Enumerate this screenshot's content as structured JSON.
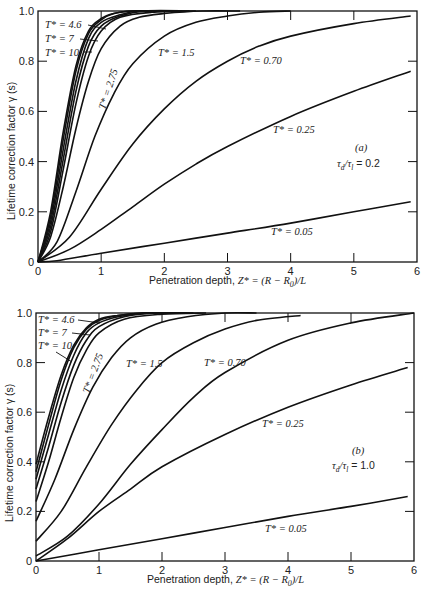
{
  "figure": {
    "panels": [
      "(a)",
      "(b)"
    ]
  },
  "chart_data": [
    {
      "type": "line",
      "panel_label": "(a)",
      "parameter_label": "τd/τl = 0.2",
      "xlabel": "Penetration depth, Z* = (R − R0)/L",
      "ylabel": "Lifetime correction factor γ (s)",
      "xlim": [
        0,
        6
      ],
      "ylim": [
        0,
        1.0
      ],
      "xticks": [
        "0",
        "1",
        "2",
        "3",
        "4",
        "5",
        "6"
      ],
      "yticks": [
        "0",
        "0.2",
        "0.4",
        "0.6",
        "0.8",
        "1.0"
      ],
      "grid": false,
      "series": [
        {
          "name": "T* = 10",
          "x": [
            0,
            0.2,
            0.4,
            0.6,
            0.8,
            1.0,
            1.2,
            1.5,
            2.0
          ],
          "y": [
            0,
            0.2,
            0.52,
            0.78,
            0.92,
            0.97,
            0.99,
            1.0,
            1.0
          ]
        },
        {
          "name": "T* = 7",
          "x": [
            0,
            0.2,
            0.4,
            0.6,
            0.8,
            1.0,
            1.2,
            1.5,
            2.0
          ],
          "y": [
            0,
            0.18,
            0.49,
            0.76,
            0.91,
            0.965,
            0.99,
            1.0,
            1.0
          ]
        },
        {
          "name": "T* = 4.6",
          "x": [
            0,
            0.2,
            0.4,
            0.6,
            0.8,
            1.0,
            1.3,
            1.6,
            2.2
          ],
          "y": [
            0,
            0.16,
            0.45,
            0.72,
            0.89,
            0.955,
            0.985,
            1.0,
            1.0
          ]
        },
        {
          "name": "T* = 3.6",
          "x": [
            0,
            0.2,
            0.4,
            0.6,
            0.8,
            1.0,
            1.3,
            1.7,
            2.4
          ],
          "y": [
            0,
            0.14,
            0.41,
            0.68,
            0.86,
            0.94,
            0.98,
            1.0,
            1.0
          ]
        },
        {
          "name": "T* = 3.1",
          "x": [
            0,
            0.2,
            0.4,
            0.6,
            0.8,
            1.0,
            1.3,
            1.8,
            2.5
          ],
          "y": [
            0,
            0.12,
            0.37,
            0.63,
            0.82,
            0.92,
            0.975,
            0.995,
            1.0
          ]
        },
        {
          "name": "T* = 2.75",
          "x": [
            0,
            0.2,
            0.4,
            0.6,
            0.8,
            1.0,
            1.3,
            1.6,
            2.0,
            2.6,
            3.2
          ],
          "y": [
            0,
            0.1,
            0.3,
            0.53,
            0.72,
            0.85,
            0.94,
            0.975,
            0.99,
            1.0,
            1.0
          ]
        },
        {
          "name": "T* = 1.5",
          "x": [
            0,
            0.3,
            0.6,
            0.9,
            1.2,
            1.5,
            2.0,
            2.5,
            3.0,
            3.5,
            4.0
          ],
          "y": [
            0,
            0.08,
            0.28,
            0.5,
            0.67,
            0.79,
            0.9,
            0.955,
            0.98,
            0.995,
            1.0
          ]
        },
        {
          "name": "T* = 0.70",
          "x": [
            0,
            0.5,
            1.0,
            1.5,
            2.0,
            2.5,
            3.0,
            3.5,
            4.0,
            5.0,
            5.9
          ],
          "y": [
            0,
            0.1,
            0.29,
            0.47,
            0.61,
            0.72,
            0.8,
            0.86,
            0.9,
            0.95,
            0.98
          ]
        },
        {
          "name": "T* = 0.25",
          "x": [
            0,
            0.5,
            1.0,
            1.5,
            2.0,
            2.5,
            3.0,
            4.0,
            5.0,
            5.9
          ],
          "y": [
            0,
            0.05,
            0.13,
            0.22,
            0.31,
            0.39,
            0.46,
            0.58,
            0.68,
            0.76
          ]
        },
        {
          "name": "T* = 0.05",
          "x": [
            0,
            0.3,
            1.0,
            2.0,
            3.0,
            4.0,
            5.0,
            5.9
          ],
          "y": [
            0,
            0.005,
            0.035,
            0.075,
            0.115,
            0.155,
            0.2,
            0.24
          ]
        }
      ]
    },
    {
      "type": "line",
      "panel_label": "(b)",
      "parameter_label": "τd/τl = 1.0",
      "xlabel": "Penetration depth, Z* = (R − R0)/L",
      "ylabel": "Lifetime correction factor γ (s)",
      "xlim": [
        0,
        6
      ],
      "ylim": [
        0,
        1.0
      ],
      "xticks": [
        "0",
        "1",
        "2",
        "3",
        "4",
        "5",
        "6"
      ],
      "yticks": [
        "0",
        "0.2",
        "0.4",
        "0.6",
        "0.8",
        "1.0"
      ],
      "grid": false,
      "series": [
        {
          "name": "T* = 10",
          "x": [
            0,
            0.2,
            0.4,
            0.6,
            0.8,
            1.0,
            1.3,
            1.7,
            2.2
          ],
          "y": [
            0.39,
            0.58,
            0.75,
            0.87,
            0.94,
            0.975,
            0.99,
            1.0,
            1.0
          ]
        },
        {
          "name": "T* = 7",
          "x": [
            0,
            0.2,
            0.4,
            0.6,
            0.8,
            1.0,
            1.3,
            1.7,
            2.3
          ],
          "y": [
            0.36,
            0.55,
            0.73,
            0.86,
            0.935,
            0.97,
            0.99,
            1.0,
            1.0
          ]
        },
        {
          "name": "T* = 4.6",
          "x": [
            0,
            0.2,
            0.4,
            0.6,
            0.8,
            1.0,
            1.3,
            1.8,
            2.4
          ],
          "y": [
            0.33,
            0.51,
            0.69,
            0.83,
            0.92,
            0.96,
            0.985,
            1.0,
            1.0
          ]
        },
        {
          "name": "T* = 3.6",
          "x": [
            0,
            0.2,
            0.4,
            0.6,
            0.8,
            1.0,
            1.4,
            1.9,
            2.5
          ],
          "y": [
            0.29,
            0.46,
            0.64,
            0.79,
            0.89,
            0.945,
            0.985,
            1.0,
            1.0
          ]
        },
        {
          "name": "T* = 3.1",
          "x": [
            0,
            0.2,
            0.4,
            0.6,
            0.8,
            1.0,
            1.4,
            2.0,
            2.7
          ],
          "y": [
            0.24,
            0.4,
            0.58,
            0.74,
            0.85,
            0.92,
            0.975,
            0.995,
            1.0
          ]
        },
        {
          "name": "T* = 2.75",
          "x": [
            0,
            0.3,
            0.6,
            0.9,
            1.2,
            1.5,
            1.9,
            2.4,
            3.0,
            3.5
          ],
          "y": [
            0.16,
            0.33,
            0.53,
            0.7,
            0.82,
            0.9,
            0.955,
            0.985,
            1.0,
            1.0
          ]
        },
        {
          "name": "T* = 1.5",
          "x": [
            0,
            0.4,
            0.8,
            1.2,
            1.6,
            2.0,
            2.5,
            3.0,
            3.5,
            4.2
          ],
          "y": [
            0.08,
            0.2,
            0.38,
            0.55,
            0.69,
            0.8,
            0.88,
            0.935,
            0.97,
            0.99
          ]
        },
        {
          "name": "T* = 0.70",
          "x": [
            0,
            0.5,
            1.0,
            1.5,
            2.0,
            2.5,
            3.0,
            4.0,
            5.0,
            6.0
          ],
          "y": [
            0.02,
            0.1,
            0.23,
            0.39,
            0.53,
            0.66,
            0.76,
            0.89,
            0.96,
            1.0
          ]
        },
        {
          "name": "T* = 0.25",
          "x": [
            0,
            0.5,
            1.0,
            1.5,
            2.0,
            3.0,
            4.0,
            5.0,
            5.9
          ],
          "y": [
            0.0,
            0.09,
            0.2,
            0.29,
            0.38,
            0.51,
            0.62,
            0.71,
            0.78
          ]
        },
        {
          "name": "T* = 0.05",
          "x": [
            0,
            1.0,
            2.0,
            3.0,
            4.0,
            5.0,
            5.9
          ],
          "y": [
            0.0,
            0.045,
            0.09,
            0.135,
            0.18,
            0.22,
            0.26
          ]
        }
      ]
    }
  ],
  "panels": {
    "a": {
      "label": "(a)",
      "ratio_tau": "τ",
      "ratio_d": "d",
      "ratio_slash": "/τ",
      "ratio_l": "l",
      "ratio_value": " = 0.2",
      "ylabel": "Lifetime correction factor  γ (s)",
      "xlabel_text": "Penetration depth, ",
      "xlabel_math": "Z* = (R − R",
      "xlabel_sub": "0",
      "xlabel_tail": ")/L",
      "labels": {
        "t46": "T* = 4.6",
        "t7": "T* = 7",
        "t10": "T* = 10",
        "t275": "T* = 2.75",
        "t15": "T* = 1.5",
        "t070": "T* = 0.70",
        "t025": "T* = 0.25",
        "t005": "T* = 0.05"
      }
    },
    "b": {
      "label": "(b)",
      "ratio_tau": "τ",
      "ratio_d": "d",
      "ratio_slash": "/τ",
      "ratio_l": "l",
      "ratio_value": " = 1.0",
      "ylabel": "Lifetime correction factor  γ (s)",
      "xlabel_text": "Penetration depth, ",
      "xlabel_math": "Z* = (R − R",
      "xlabel_sub": "0",
      "xlabel_tail": ")/L",
      "labels": {
        "t46": "T* = 4.6",
        "t7": "T* = 7",
        "t10": "T* = 10",
        "t275": "T* = 2.75",
        "t15": "T* = 1.5",
        "t070": "T* = 0.70",
        "t025": "T* = 0.25",
        "t005": "T* = 0.05"
      }
    }
  }
}
